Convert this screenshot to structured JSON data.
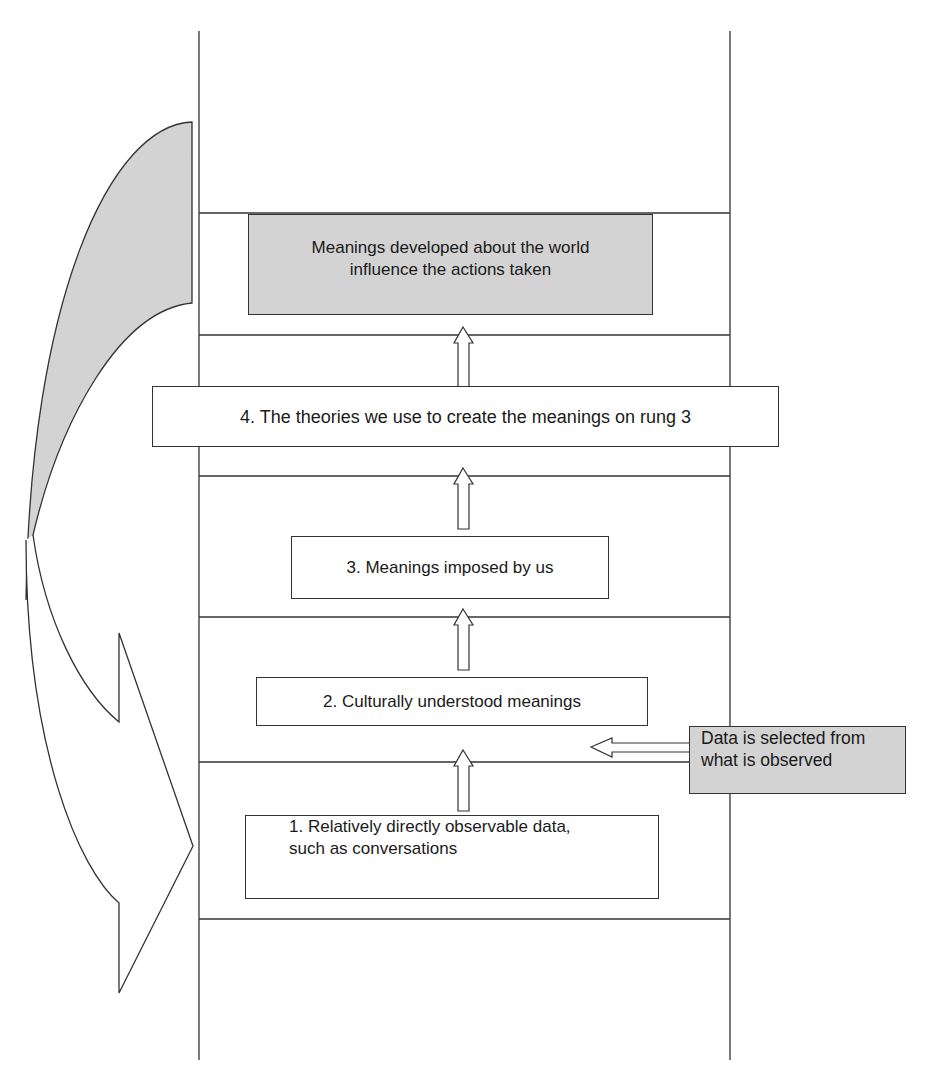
{
  "diagram": {
    "colors": {
      "shaded": "#d3d3d3",
      "line": "#333333",
      "background": "#ffffff"
    },
    "top_box": {
      "text": "Meanings developed about the world influence the actions taken",
      "line1": "Meanings developed about the world",
      "line2": "influence the actions taken"
    },
    "rungs": [
      {
        "id": 4,
        "text": "4. The theories we use to create the meanings on rung 3"
      },
      {
        "id": 3,
        "text": "3. Meanings imposed by us"
      },
      {
        "id": 2,
        "text": "2. Culturally understood meanings"
      },
      {
        "id": 1,
        "line1": "1. Relatively directly observable data,",
        "line2": "such as conversations"
      }
    ],
    "side_box": {
      "line1": "Data is selected from",
      "line2": "what is observed"
    },
    "arrows": [
      {
        "from": "rung-1",
        "to": "rung-2",
        "direction": "up"
      },
      {
        "from": "rung-2",
        "to": "rung-3",
        "direction": "up"
      },
      {
        "from": "rung-3",
        "to": "rung-4",
        "direction": "up"
      },
      {
        "from": "rung-4",
        "to": "top-box",
        "direction": "up"
      },
      {
        "from": "side-box",
        "to": "ladder",
        "direction": "left"
      },
      {
        "from": "top-box",
        "to": "rung-1",
        "direction": "curved-down",
        "meaning": "feedback loop"
      }
    ]
  }
}
